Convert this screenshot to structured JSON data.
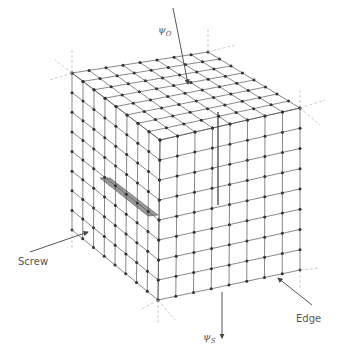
{
  "figure": {
    "type": "crystal-lattice-dislocation-diagram",
    "labels": {
      "screw": "Screw",
      "edge": "Edge",
      "psi_o": "ψ",
      "psi_o_sub": "O",
      "psi_s": "ψ",
      "psi_s_sub": "S"
    },
    "grid_divisions": 8,
    "colors": {
      "line": "#555555",
      "node": "#333333",
      "shaded": "#999999",
      "label": "#555555"
    },
    "corners": {
      "top_back": [
        208,
        52
      ],
      "top_left": [
        72,
        73
      ],
      "top_right": [
        300,
        108
      ],
      "top_front": [
        160,
        140
      ],
      "bottom_left": [
        72,
        230
      ],
      "bottom_right": [
        300,
        270
      ],
      "bottom_front": [
        158,
        300
      ]
    }
  }
}
